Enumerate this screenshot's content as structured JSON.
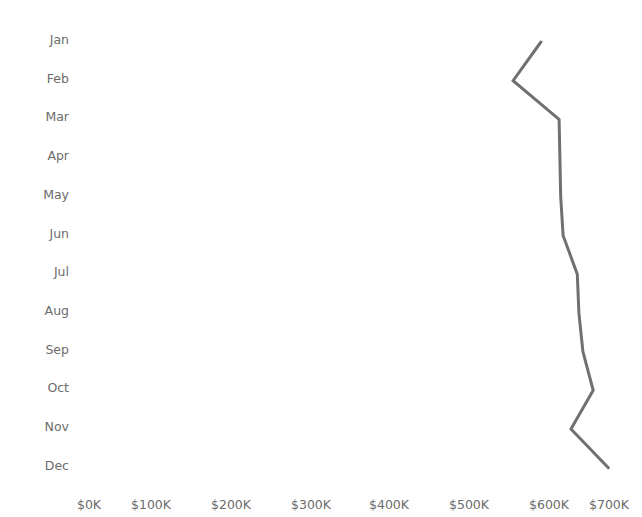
{
  "chart_data": {
    "type": "line",
    "title": "",
    "xlabel": "",
    "ylabel": "",
    "orientation": "horizontal-values",
    "categories": [
      "Jan",
      "Feb",
      "Mar",
      "Apr",
      "May",
      "Jun",
      "Jul",
      "Aug",
      "Sep",
      "Oct",
      "Nov",
      "Dec"
    ],
    "values": [
      590,
      555,
      613,
      614,
      615,
      618,
      636,
      638,
      643,
      656,
      628,
      675
    ],
    "value_units": "thousands USD",
    "x_ticks": [
      "$0K",
      "$100K",
      "$200K",
      "$300K",
      "$400K",
      "$500K",
      "$600K",
      "$700K"
    ],
    "xlim": [
      0,
      700
    ],
    "grid": false,
    "line_color": "#707070"
  },
  "header": {
    "title_partial": ""
  },
  "axis": {
    "y_labels": [
      "Jan",
      "Feb",
      "Mar",
      "Apr",
      "May",
      "Jun",
      "Jul",
      "Aug",
      "Sep",
      "Oct",
      "Nov",
      "Dec"
    ],
    "x_labels": [
      "$0K",
      "$100K",
      "$200K",
      "$300K",
      "$400K",
      "$500K",
      "$600K",
      "$700K"
    ]
  }
}
